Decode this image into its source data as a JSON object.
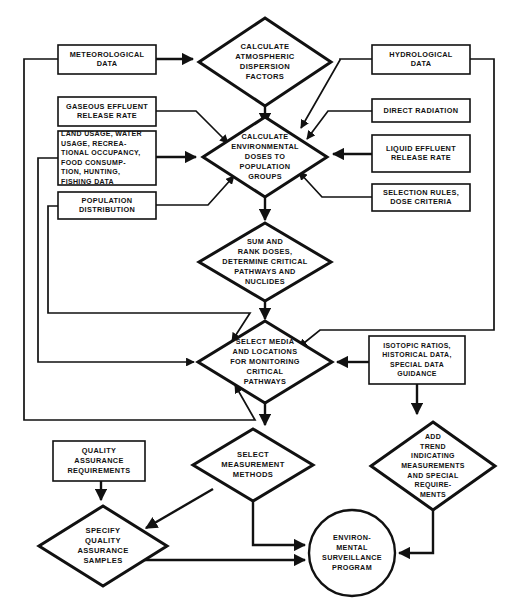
{
  "diagram": {
    "type": "flowchart",
    "background": "#ffffff",
    "line_color": "#111111",
    "text_color": "#111111"
  },
  "nodes": {
    "meteorological_data": {
      "shape": "rect",
      "lines": [
        "METEOROLOGICAL",
        "DATA"
      ],
      "x": 58,
      "y": 45,
      "w": 98,
      "h": 29
    },
    "calc_atmospheric": {
      "shape": "diamond",
      "lines": [
        "CALCULATE",
        "ATMOSPHERIC",
        "DISPERSION",
        "FACTORS"
      ],
      "cx": 265,
      "cy": 62,
      "rx": 66,
      "ry": 44
    },
    "hydrological_data": {
      "shape": "rect",
      "lines": [
        "HYDROLOGICAL",
        "DATA"
      ],
      "x": 372,
      "y": 45,
      "w": 98,
      "h": 29
    },
    "gaseous_effluent": {
      "shape": "rect",
      "lines": [
        "GASEOUS EFFLUENT",
        "RELEASE RATE"
      ],
      "x": 58,
      "y": 97,
      "w": 98,
      "h": 29
    },
    "direct_radiation": {
      "shape": "rect",
      "lines": [
        "DIRECT RADIATION"
      ],
      "x": 372,
      "y": 99,
      "w": 98,
      "h": 23
    },
    "land_usage": {
      "shape": "rect",
      "lines": [
        "LAND USAGE, WATER",
        "USAGE, RECREA-",
        "TIONAL OCCUPANCY,",
        "FOOD CONSUMP-",
        "TION, HUNTING,",
        "FISHING DATA"
      ],
      "x": 58,
      "y": 131,
      "w": 98,
      "h": 54
    },
    "calc_env_doses": {
      "shape": "diamond",
      "lines": [
        "CALCULATE",
        "ENVIRONMENTAL",
        "DOSES TO",
        "POPULATION",
        "GROUPS"
      ],
      "cx": 265,
      "cy": 157,
      "rx": 62,
      "ry": 40
    },
    "liquid_effluent": {
      "shape": "rect",
      "lines": [
        "LIQUID EFFLUENT",
        "RELEASE RATE"
      ],
      "x": 372,
      "y": 135,
      "w": 98,
      "h": 37
    },
    "population_distribution": {
      "shape": "rect",
      "lines": [
        "POPULATION",
        "DISTRIBUTION"
      ],
      "x": 58,
      "y": 192,
      "w": 98,
      "h": 27
    },
    "selection_rules": {
      "shape": "rect",
      "lines": [
        "SELECTION RULES,",
        "DOSE CRITERIA"
      ],
      "x": 372,
      "y": 184,
      "w": 98,
      "h": 27
    },
    "sum_rank_doses": {
      "shape": "diamond",
      "lines": [
        "SUM AND",
        "RANK DOSES,",
        "DETERMINE CRITICAL",
        "PATHWAYS AND",
        "NUCLIDES"
      ],
      "cx": 265,
      "cy": 262,
      "rx": 66,
      "ry": 39
    },
    "select_media": {
      "shape": "diamond",
      "lines": [
        "SELECT MEDIA",
        "AND LOCATIONS",
        "FOR MONITORING",
        "CRITICAL",
        "PATHWAYS"
      ],
      "cx": 265,
      "cy": 362,
      "rx": 67,
      "ry": 41
    },
    "isotopic_ratios": {
      "shape": "rect",
      "lines": [
        "ISOTOPIC RATIOS,",
        "HISTORICAL DATA,",
        "SPECIAL DATA",
        "GUIDANCE"
      ],
      "x": 369,
      "y": 336,
      "w": 96,
      "h": 48
    },
    "select_measurement": {
      "shape": "diamond",
      "lines": [
        "SELECT",
        "MEASUREMENT",
        "METHODS"
      ],
      "cx": 253,
      "cy": 465,
      "rx": 60,
      "ry": 36
    },
    "add_trend": {
      "shape": "diamond",
      "lines": [
        "ADD",
        "TREND",
        "INDICATING",
        "MEASUREMENTS",
        "AND SPECIAL",
        "REQUIRE-",
        "MENTS"
      ],
      "cx": 433,
      "cy": 466,
      "rx": 62,
      "ry": 44
    },
    "quality_assurance_req": {
      "shape": "rect",
      "lines": [
        "QUALITY",
        "ASSURANCE",
        "REQUIREMENTS"
      ],
      "x": 53,
      "y": 441,
      "w": 92,
      "h": 40
    },
    "specify_qa_samples": {
      "shape": "diamond",
      "lines": [
        "SPECIFY",
        "QUALITY",
        "ASSURANCE",
        "SAMPLES"
      ],
      "cx": 103,
      "cy": 546,
      "rx": 64,
      "ry": 40
    },
    "environmental_surveillance": {
      "shape": "circle",
      "lines": [
        "ENVIRON-",
        "MENTAL",
        "SURVEILLANCE",
        "PROGRAM"
      ],
      "cx": 352,
      "cy": 553,
      "r": 43
    }
  },
  "edges": [
    {
      "from": "meteorological_data",
      "to": "calc_atmospheric"
    },
    {
      "from": "hydrological_data",
      "to": "calc_env_doses"
    },
    {
      "from": "calc_atmospheric",
      "to": "calc_env_doses"
    },
    {
      "from": "gaseous_effluent",
      "to": "calc_env_doses"
    },
    {
      "from": "direct_radiation",
      "to": "calc_env_doses"
    },
    {
      "from": "land_usage",
      "to": "calc_env_doses"
    },
    {
      "from": "liquid_effluent",
      "to": "calc_env_doses"
    },
    {
      "from": "population_distribution",
      "to": "calc_env_doses"
    },
    {
      "from": "selection_rules",
      "to": "calc_env_doses"
    },
    {
      "from": "calc_env_doses",
      "to": "sum_rank_doses"
    },
    {
      "from": "sum_rank_doses",
      "to": "select_media"
    },
    {
      "from": "hydrological_data",
      "to": "select_media"
    },
    {
      "from": "isotopic_ratios",
      "to": "select_media"
    },
    {
      "from": "meteorological_data",
      "to": "select_media",
      "note": "left feedback loop"
    },
    {
      "from": "land_usage",
      "to": "select_media",
      "note": "left feedback loop"
    },
    {
      "from": "population_distribution",
      "to": "select_media",
      "note": "left feedback loop"
    },
    {
      "from": "select_media",
      "to": "select_measurement"
    },
    {
      "from": "isotopic_ratios",
      "to": "add_trend"
    },
    {
      "from": "select_measurement",
      "to": "specify_qa_samples"
    },
    {
      "from": "quality_assurance_req",
      "to": "specify_qa_samples"
    },
    {
      "from": "select_measurement",
      "to": "environmental_surveillance"
    },
    {
      "from": "specify_qa_samples",
      "to": "environmental_surveillance"
    },
    {
      "from": "add_trend",
      "to": "environmental_surveillance"
    }
  ]
}
